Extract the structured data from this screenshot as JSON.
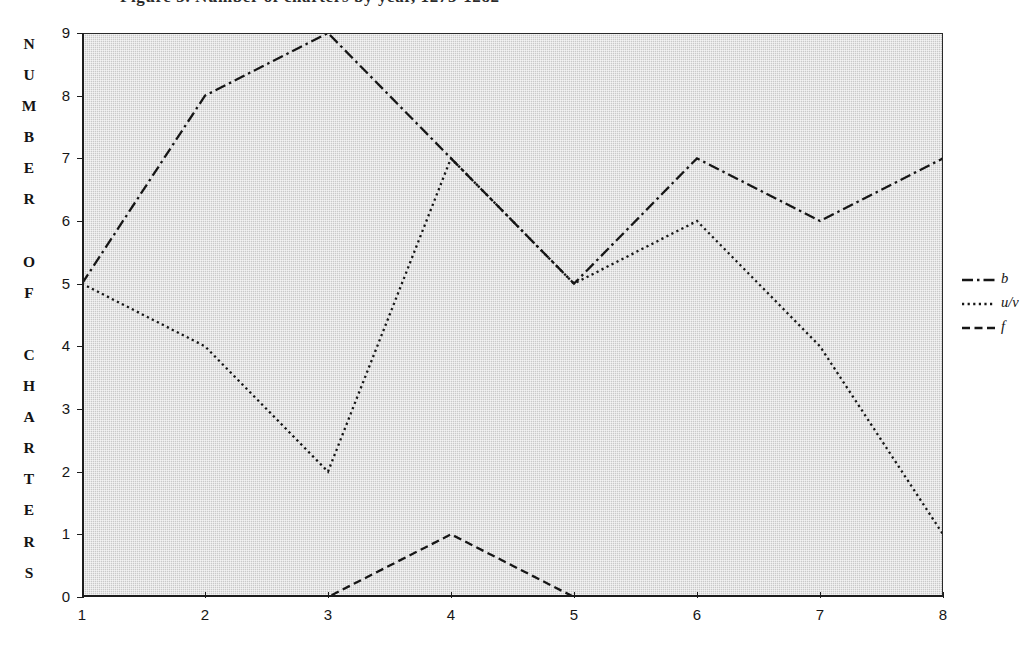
{
  "figure": {
    "clipped_title": "Figure 3. Number of charters by year, 1275-1282"
  },
  "axes": {
    "y_axis_title_text": "NUMBER OF CHARTERS",
    "y_axis_title_chars": [
      "N",
      "U",
      "M",
      "B",
      "E",
      "R",
      "",
      "O",
      "F",
      "",
      "C",
      "H",
      "A",
      "R",
      "T",
      "E",
      "R",
      "S"
    ],
    "y_ticks": [
      "9",
      "8",
      "7",
      "6",
      "5",
      "4",
      "3",
      "2",
      "1",
      "0"
    ],
    "x_ticks": [
      "1",
      "2",
      "3",
      "4",
      "5",
      "6",
      "7",
      "8"
    ],
    "y_min": 0,
    "y_max": 9,
    "x_min": 1,
    "x_max": 8
  },
  "legend": {
    "position": "right",
    "entries": [
      {
        "label": "b",
        "dash": "dash-dot",
        "name": "legend-item-b"
      },
      {
        "label": "u/v",
        "dash": "dotted",
        "name": "legend-item-uv"
      },
      {
        "label": "f",
        "dash": "dashed",
        "name": "legend-item-f"
      }
    ]
  },
  "colors": {
    "line": "#161616",
    "plot_background": "#c9c9c9",
    "page_background": "#ffffff",
    "axis": "#1c1c1c"
  },
  "chart_data": {
    "type": "line",
    "title": "Figure 3. Number of charters by year, 1275-1282",
    "xlabel": "",
    "ylabel": "NUMBER OF CHARTERS",
    "x": [
      1,
      2,
      3,
      4,
      5,
      6,
      7,
      8
    ],
    "categories": [
      "1",
      "2",
      "3",
      "4",
      "5",
      "6",
      "7",
      "8"
    ],
    "xlim": [
      1,
      8
    ],
    "ylim": [
      0,
      9
    ],
    "grid": false,
    "legend_position": "right",
    "series": [
      {
        "name": "b",
        "values": [
          5,
          8,
          9,
          7,
          5,
          7,
          6,
          7
        ],
        "dash": "dash-dot",
        "color": "#161616"
      },
      {
        "name": "u/v",
        "values": [
          5,
          4,
          2,
          7,
          5,
          6,
          4,
          1
        ],
        "dash": "dotted",
        "color": "#161616"
      },
      {
        "name": "f",
        "values": [
          0,
          0,
          0,
          1,
          0,
          0,
          0,
          0
        ],
        "dash": "dashed",
        "color": "#161616"
      }
    ]
  }
}
